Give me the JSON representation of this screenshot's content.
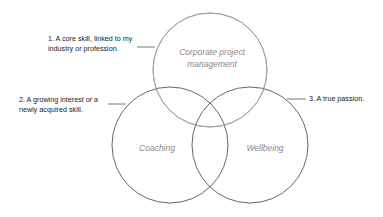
{
  "diagram": {
    "type": "venn",
    "circles": [
      {
        "id": "top",
        "label_lines": [
          "Corporate project",
          "management"
        ],
        "cx": 210,
        "cy": 70,
        "r": 57
      },
      {
        "id": "left",
        "label_lines": [
          "Coaching"
        ],
        "cx": 170,
        "cy": 145,
        "r": 58
      },
      {
        "id": "right",
        "label_lines": [
          "Wellbeing"
        ],
        "cx": 250,
        "cy": 145,
        "r": 58
      }
    ],
    "annotations": [
      {
        "id": "1",
        "lines": [
          "1. A core skill, linked to my",
          "industry or profession."
        ]
      },
      {
        "id": "2",
        "lines": [
          "2. A growing interest or a",
          "newly acquired skill."
        ]
      },
      {
        "id": "3",
        "lines": [
          "3. A true passion."
        ]
      }
    ],
    "colors": {
      "stroke_dark": "#555555",
      "stroke_light": "#b0b0b0",
      "label_text": "#8a8a8a",
      "note_text": "#222222"
    }
  }
}
